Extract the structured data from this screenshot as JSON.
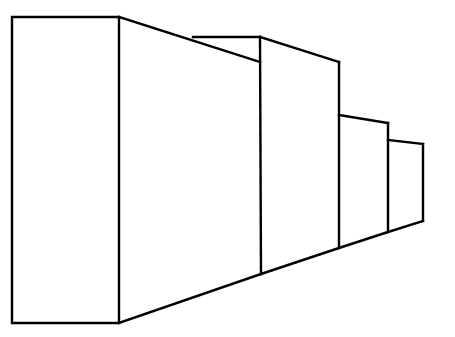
{
  "diagram": {
    "title": "",
    "colors": {
      "background": "#ffffff",
      "stroke": "#000000"
    },
    "boxes": [
      {
        "id": "box-1",
        "front_face": [
          [
            12,
            17
          ],
          [
            119,
            17
          ],
          [
            119,
            323
          ],
          [
            12,
            323
          ]
        ]
      },
      {
        "id": "box-2",
        "side_face": [
          [
            193,
            37
          ],
          [
            260,
            37
          ],
          [
            260,
            274
          ]
        ]
      },
      {
        "id": "box-3",
        "side_face": [
          [
            260,
            37
          ],
          [
            339,
            62
          ],
          [
            339,
            248
          ],
          [
            261,
            274
          ]
        ]
      },
      {
        "id": "box-4",
        "side_face": [
          [
            339,
            115
          ],
          [
            388,
            123
          ],
          [
            388,
            232
          ],
          [
            339,
            248
          ]
        ]
      },
      {
        "id": "box-5",
        "side_face": [
          [
            388,
            140
          ],
          [
            423,
            144
          ],
          [
            423,
            221
          ],
          [
            388,
            232
          ]
        ]
      }
    ]
  }
}
